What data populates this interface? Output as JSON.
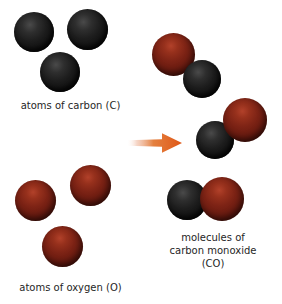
{
  "diagram": {
    "title_text": "",
    "background_color": "#ffffff",
    "colors": {
      "carbon": "#1d1d1d",
      "oxygen": "#7d2315",
      "arrow": "#e2601f",
      "text": "#262626"
    },
    "groups": [
      {
        "id": "carbon-reactant",
        "label": "atoms of carbon (C)",
        "element": "C",
        "atom_count": 3,
        "atom_type": "carbon"
      },
      {
        "id": "oxygen-reactant",
        "label": "atoms of oxygen (O)",
        "element": "O",
        "atom_count": 3,
        "atom_type": "oxygen"
      },
      {
        "id": "co-product",
        "label_lines": [
          "molecules of",
          "carbon monoxide",
          "(CO)"
        ],
        "formula": "CO",
        "molecule_count": 3,
        "atoms_per_molecule": 2
      }
    ],
    "arrow": {
      "name": "reaction-arrow",
      "direction": "right",
      "color": "#e2601f"
    }
  }
}
